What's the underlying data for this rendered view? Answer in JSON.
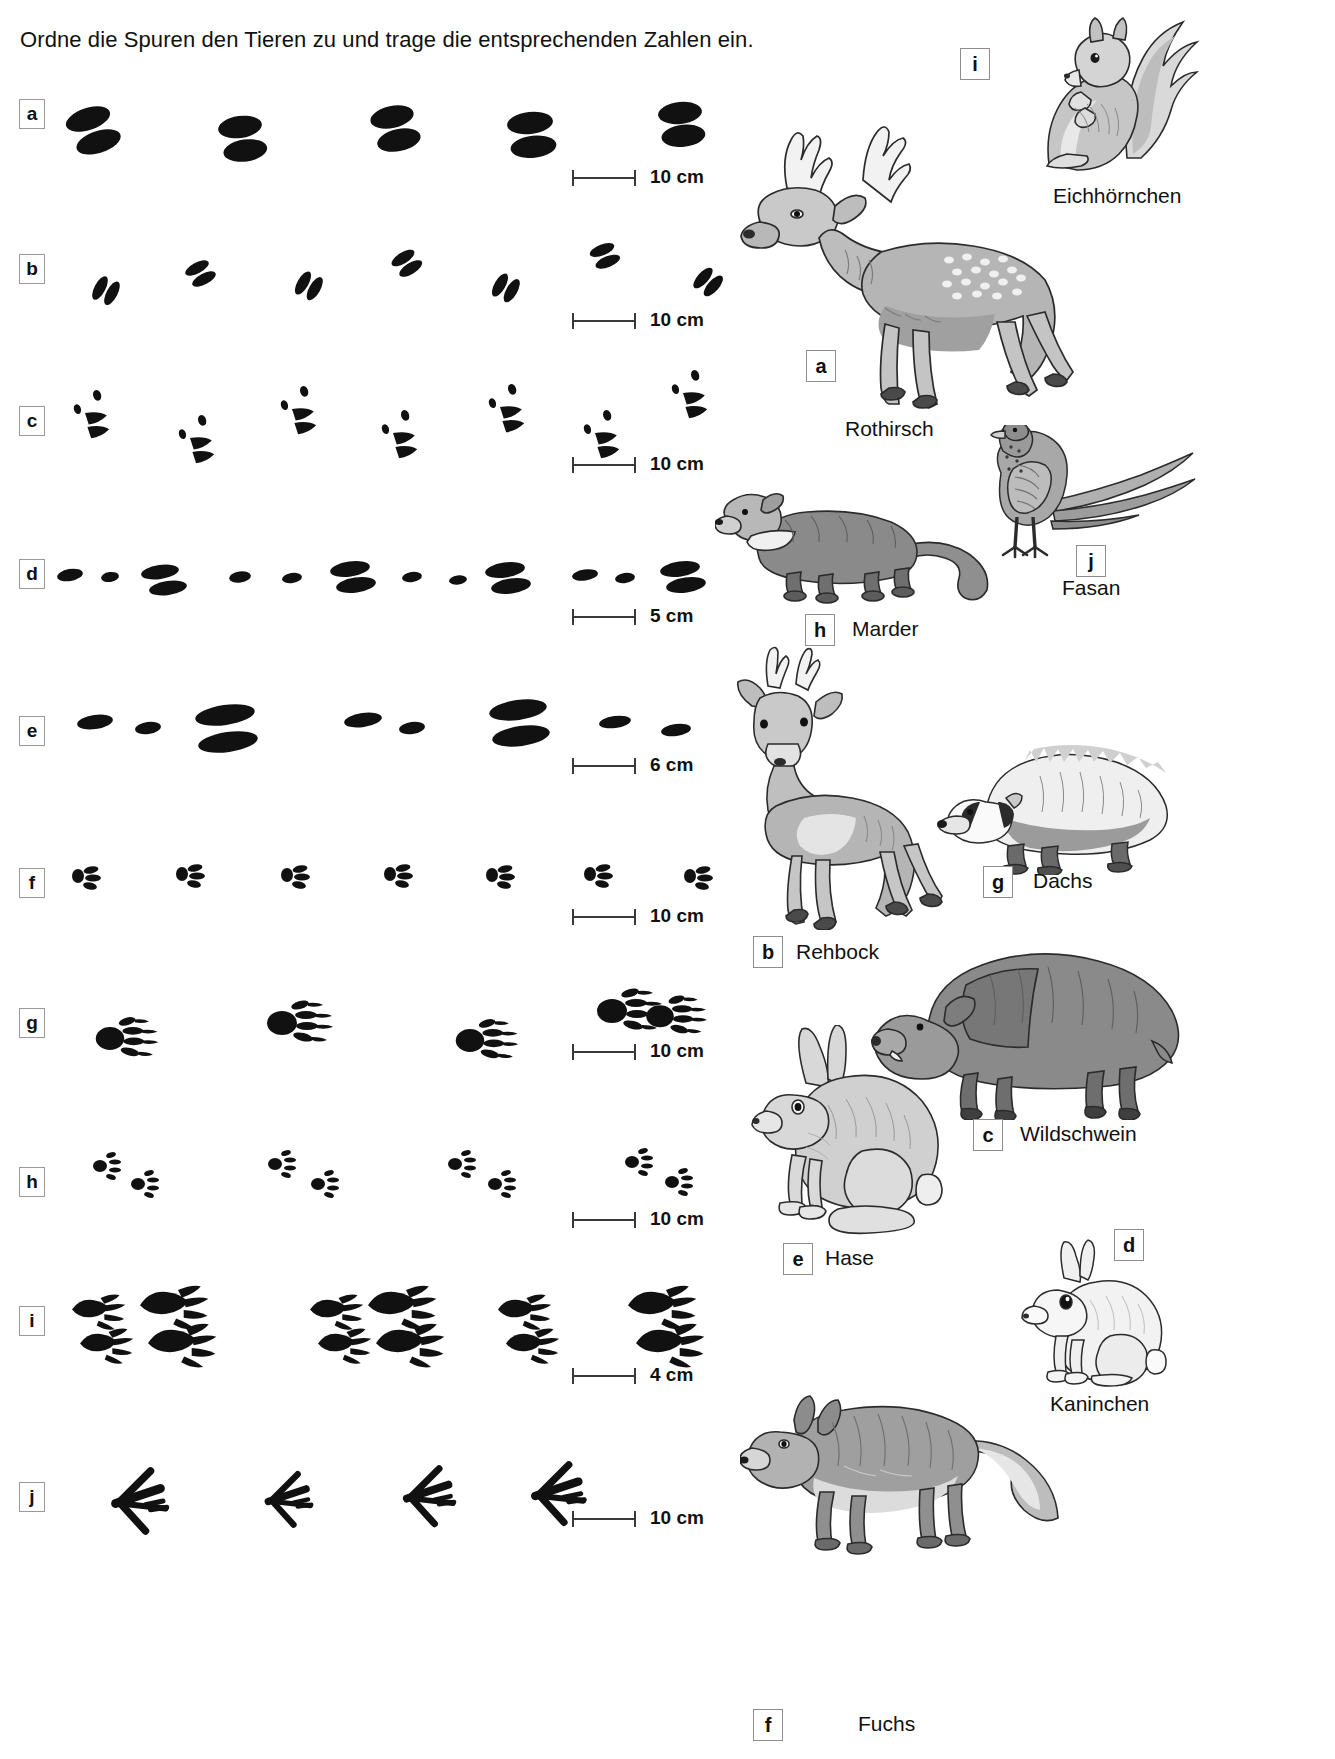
{
  "instruction": "Ordne die Spuren den Tieren zu und trage die entsprechenden Zahlen ein.",
  "track_rows": [
    {
      "letter": "a",
      "scale_label": "10 cm",
      "track_type": "cloven-hoof-large"
    },
    {
      "letter": "b",
      "scale_label": "10 cm",
      "track_type": "cloven-hoof-small"
    },
    {
      "letter": "c",
      "scale_label": "10 cm",
      "track_type": "cloven-hoof-with-dewclaws"
    },
    {
      "letter": "d",
      "scale_label": "5 cm",
      "track_type": "paw-elongated-pairs"
    },
    {
      "letter": "e",
      "scale_label": "6 cm",
      "track_type": "paw-oval-groups"
    },
    {
      "letter": "f",
      "scale_label": "10 cm",
      "track_type": "paw-four-toe-small"
    },
    {
      "letter": "g",
      "scale_label": "10 cm",
      "track_type": "paw-clawed-broad"
    },
    {
      "letter": "h",
      "scale_label": "10 cm",
      "track_type": "paw-five-toe-tiny"
    },
    {
      "letter": "i",
      "scale_label": "4 cm",
      "track_type": "hand-like-long-toes"
    },
    {
      "letter": "j",
      "scale_label": "10 cm",
      "track_type": "bird-three-toe"
    }
  ],
  "animals": [
    {
      "id": "eichhoernchen",
      "name": "Eichhörnchen",
      "answer": "i"
    },
    {
      "id": "rothirsch",
      "name": "Rothirsch",
      "answer": "a"
    },
    {
      "id": "marder",
      "name": "Marder",
      "answer": "h"
    },
    {
      "id": "fasan",
      "name": "Fasan",
      "answer": "j"
    },
    {
      "id": "rehbock",
      "name": "Rehbock",
      "answer": "b"
    },
    {
      "id": "dachs",
      "name": "Dachs",
      "answer": "g"
    },
    {
      "id": "wildschwein",
      "name": "Wildschwein",
      "answer": "c"
    },
    {
      "id": "hase",
      "name": "Hase",
      "answer": "e"
    },
    {
      "id": "kaninchen",
      "name": "Kaninchen",
      "answer": "d"
    },
    {
      "id": "fuchs",
      "name": "Fuchs",
      "answer": "f"
    }
  ],
  "colors": {
    "ink": "#111111",
    "box_border": "#8e8e8e",
    "scale_line": "#3a3a3a",
    "fur_light": "#d9d9d9",
    "fur_mid": "#a8a8a8",
    "fur_dark": "#6e6e6e",
    "outline": "#2b2b2b"
  }
}
